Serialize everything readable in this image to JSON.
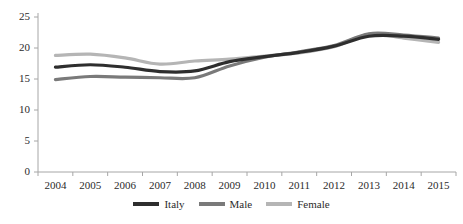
{
  "chart_data": {
    "type": "line",
    "title": "",
    "subtitle": "",
    "xlabel": "",
    "ylabel": "",
    "categories": [
      "2004",
      "2005",
      "2006",
      "2007",
      "2008",
      "2009",
      "2010",
      "2011",
      "2012",
      "2013",
      "2014",
      "2015"
    ],
    "series": [
      {
        "name": "Italy",
        "color": "#2e2e2e",
        "values": [
          16.9,
          17.3,
          16.9,
          16.2,
          16.3,
          17.8,
          18.6,
          19.3,
          20.3,
          21.9,
          21.9,
          21.4
        ]
      },
      {
        "name": "Male",
        "color": "#7a7a7a",
        "values": [
          14.9,
          15.4,
          15.3,
          15.2,
          15.2,
          17.1,
          18.5,
          19.4,
          20.4,
          22.3,
          22.1,
          21.6
        ]
      },
      {
        "name": "Female",
        "color": "#b5b5b5",
        "values": [
          18.8,
          19.0,
          18.4,
          17.4,
          17.9,
          18.2,
          18.7,
          19.2,
          20.2,
          22.2,
          21.6,
          20.9
        ]
      }
    ],
    "ylim": [
      0,
      25
    ],
    "yticks": [
      0,
      5,
      10,
      15,
      20,
      25
    ],
    "ytick_labels": [
      "0",
      "5",
      "10",
      "15",
      "20",
      "25"
    ],
    "grid": false,
    "legend_position": "bottom",
    "legend_entries": [
      {
        "label": "Italy",
        "color": "#2e2e2e",
        "swatch": "line-swatch"
      },
      {
        "label": "Male",
        "color": "#7a7a7a",
        "swatch": "line-swatch"
      },
      {
        "label": "Female",
        "color": "#b5b5b5",
        "swatch": "line-swatch"
      }
    ],
    "axis_color": "#a6a6a6",
    "background": "#ffffff"
  }
}
